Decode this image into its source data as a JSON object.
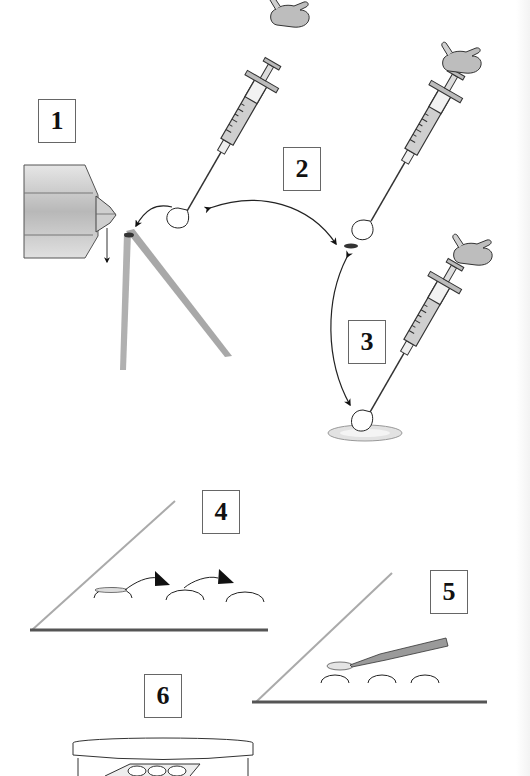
{
  "diagram": {
    "type": "procedure-illustration",
    "steps": [
      {
        "number": "1",
        "depicts": "cryoprobe tip with droplet dropped onto angled slide"
      },
      {
        "number": "2",
        "depicts": "syringe releasing droplet onto specimen"
      },
      {
        "number": "3",
        "depicts": "syringe depositing droplet onto dish"
      },
      {
        "number": "4",
        "depicts": "slide with drops, specimen transferred between drops"
      },
      {
        "number": "5",
        "depicts": "pipette picking specimen from drop on slide"
      },
      {
        "number": "6",
        "depicts": "petri dish containing specimens"
      }
    ]
  },
  "colors": {
    "line": "#222222",
    "gray_fill": "#bdbdbd",
    "light_fill": "#dcdcdc",
    "slide": "#a9a9a9",
    "background": "#ffffff"
  }
}
